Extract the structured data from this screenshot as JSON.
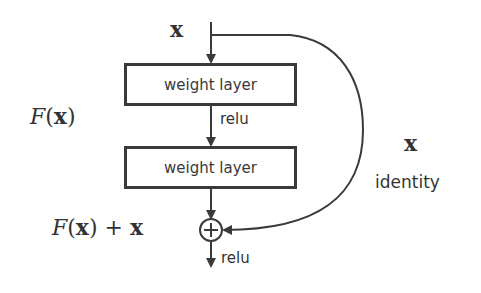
{
  "diagram": {
    "input_label": "x",
    "layers": [
      {
        "label": "weight layer"
      },
      {
        "label": "weight layer"
      }
    ],
    "activation_between": "relu",
    "activation_after_sum": "relu",
    "residual_function_label": {
      "script": "F",
      "open": "(",
      "var": "x",
      "close": ")"
    },
    "sum_label": {
      "script": "F",
      "open": "(",
      "var": "x",
      "close": ")",
      "plus": " + ",
      "var2": "x"
    },
    "shortcut_var": "x",
    "shortcut_label": "identity",
    "sum_symbol": "+",
    "colors": {
      "stroke": "#3a3a3a",
      "text": "#333333",
      "background": "#ffffff"
    }
  }
}
